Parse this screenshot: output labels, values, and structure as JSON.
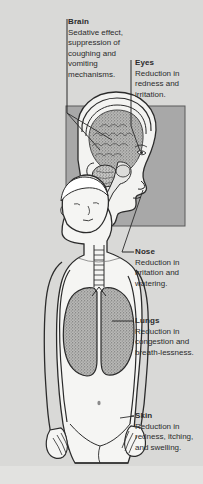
{
  "figure": {
    "background_color": "#d9d9d7",
    "inset_panel_color": "#a8a8a8",
    "text_color": "#2b2b2b"
  },
  "labels": [
    {
      "id": "brain",
      "heading": "Brain",
      "body": "Sedative effect, suppression of coughing and vomiting mechanisms."
    },
    {
      "id": "eyes",
      "heading": "Eyes",
      "body": "Reduction in redness and irritation."
    },
    {
      "id": "nose",
      "heading": "Nose",
      "body": "Reduction in irritation and watering."
    },
    {
      "id": "lungs",
      "heading": "Lungs",
      "body": "Reduction in congestion and breath-lessness."
    },
    {
      "id": "skin",
      "heading": "Skin",
      "body": "Reduction in redness, itching, and swelling."
    }
  ],
  "anatomy": {
    "head_profile": "head-profile-illustration",
    "brain_cortex": "brain-cortex-illustration",
    "cerebellum": "cerebellum-illustration",
    "brainstem": "brainstem-illustration",
    "torso": "male-torso-illustration",
    "trachea": "trachea-illustration",
    "left_lung": "left-lung-illustration",
    "right_lung": "right-lung-illustration"
  }
}
